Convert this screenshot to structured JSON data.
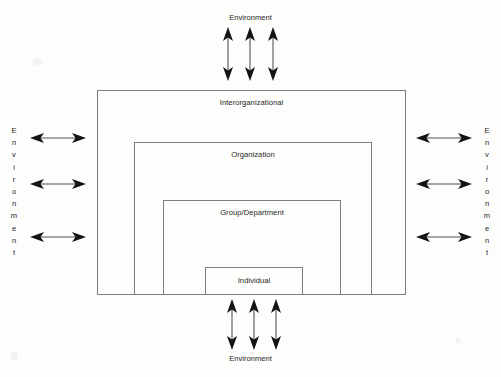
{
  "diagram": {
    "levels": [
      {
        "id": "interorganizational",
        "label": "Interorganizational"
      },
      {
        "id": "organization",
        "label": "Organization"
      },
      {
        "id": "group_department",
        "label": "Group/Department"
      },
      {
        "id": "individual",
        "label": "Individual"
      }
    ],
    "environment_labels": {
      "top": "Environment",
      "bottom": "Environment",
      "left": "Environment",
      "right": "Environment"
    },
    "environment_letters": {
      "left": [
        "E",
        "n",
        "v",
        "i",
        "r",
        "o",
        "n",
        "m",
        "e",
        "n",
        "t"
      ],
      "right": [
        "E",
        "n",
        "v",
        "i",
        "r",
        "o",
        "n",
        "m",
        "e",
        "n",
        "t"
      ]
    },
    "arrows": {
      "style": "double-headed",
      "top_count": 3,
      "bottom_count": 3,
      "left_count": 3,
      "right_count": 3,
      "semantic": "bidirectional-exchange"
    },
    "colors": {
      "background": "#fdfdfc",
      "box_stroke": "#7d7d7d",
      "arrow_head": "#141414",
      "arrow_shaft": "#8a8a8a",
      "text": "#1f1f1f"
    }
  }
}
